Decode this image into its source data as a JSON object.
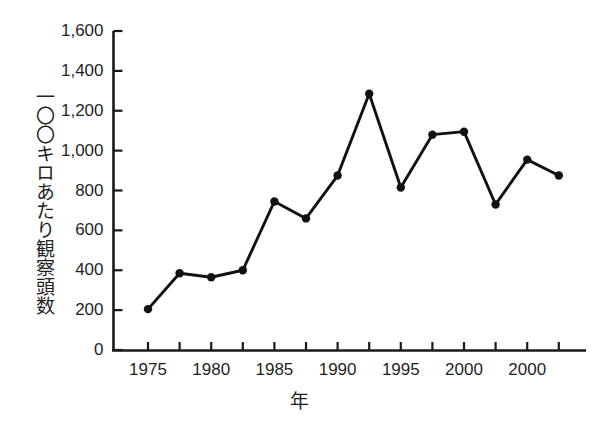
{
  "chart_data": {
    "type": "line",
    "title": "",
    "subtitle": "",
    "xlabel": "年",
    "ylabel": "一〇〇キロあたり観察頭数",
    "x": [
      1975,
      1977.5,
      1980,
      1982.5,
      1985,
      1987.5,
      1990,
      1992.5,
      1995,
      1997.5,
      2000,
      2002.5,
      2005,
      2007.5
    ],
    "values": [
      205,
      385,
      365,
      400,
      745,
      660,
      875,
      1285,
      815,
      1080,
      1095,
      730,
      955,
      875
    ],
    "series": [
      {
        "name": "一〇〇キロあたり観察頭数",
        "values": [
          205,
          385,
          365,
          400,
          745,
          660,
          875,
          1285,
          815,
          1080,
          1095,
          730,
          955,
          875
        ]
      }
    ],
    "xlim": [
      1973.75,
      2008.75
    ],
    "ylim": [
      0,
      1600
    ],
    "ytick_values": [
      0,
      200,
      400,
      600,
      800,
      1000,
      1200,
      1400,
      1600
    ],
    "ytick_labels": [
      "0",
      "200",
      "400",
      "600",
      "800",
      "1,000",
      "1,200",
      "1,400",
      "1,600"
    ],
    "xtick_values": [
      1975,
      1977.5,
      1980,
      1982.5,
      1985,
      1987.5,
      1990,
      1992.5,
      1995,
      1997.5,
      2000,
      2002.5,
      2005,
      2007.5
    ],
    "xtick_labels": [
      "1975",
      "",
      "1980",
      "",
      "1985",
      "",
      "1990",
      "",
      "1995",
      "",
      "2000",
      "",
      "2000",
      ""
    ],
    "grid": false,
    "legend": false,
    "legend_position": "none",
    "marker": "filled-circle",
    "line_color": "#111111",
    "marker_color": "#111111",
    "axis_color": "#1a1a1a",
    "background_color": "#ffffff"
  },
  "axis": {
    "y_ticks": [
      {
        "label": "1,600",
        "value": 1600
      },
      {
        "label": "1,400",
        "value": 1400
      },
      {
        "label": "1,200",
        "value": 1200
      },
      {
        "label": "1,000",
        "value": 1000
      },
      {
        "label": "800",
        "value": 800
      },
      {
        "label": "600",
        "value": 600
      },
      {
        "label": "400",
        "value": 400
      },
      {
        "label": "200",
        "value": 200
      },
      {
        "label": "0",
        "value": 0
      }
    ],
    "x_ticks": [
      {
        "label": "1975",
        "value": 1975
      },
      {
        "label": "1980",
        "value": 1980
      },
      {
        "label": "1985",
        "value": 1985
      },
      {
        "label": "1990",
        "value": 1990
      },
      {
        "label": "1995",
        "value": 1995
      },
      {
        "label": "2000",
        "value": 2000
      },
      {
        "label": "2000",
        "value": 2005
      }
    ],
    "y_title": "一〇〇キロあたり観察頭数",
    "x_title": "年"
  }
}
